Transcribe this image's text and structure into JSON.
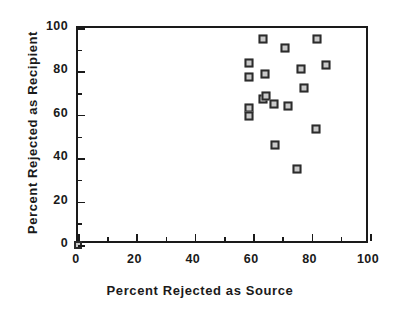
{
  "chart_data": {
    "type": "scatter",
    "title": "",
    "xlabel": "Percent Rejected as Source",
    "ylabel": "Percent Rejected as Recipient",
    "xlim": [
      0,
      100
    ],
    "ylim": [
      0,
      100
    ],
    "xticks": [
      0,
      20,
      40,
      60,
      80,
      100
    ],
    "yticks": [
      0,
      20,
      40,
      60,
      80,
      100
    ],
    "x_minor_ticks": [
      10,
      30,
      50,
      70,
      90
    ],
    "y_minor_ticks": [
      10,
      30,
      50,
      70,
      90
    ],
    "grid": false,
    "legend": null,
    "marker": "open-square",
    "points": [
      {
        "x": 0.0,
        "y": 0.0
      },
      {
        "x": 58.5,
        "y": 84.0
      },
      {
        "x": 58.5,
        "y": 77.5
      },
      {
        "x": 58.5,
        "y": 63.0
      },
      {
        "x": 58.5,
        "y": 59.5
      },
      {
        "x": 63.5,
        "y": 95.0
      },
      {
        "x": 64.0,
        "y": 79.0
      },
      {
        "x": 63.5,
        "y": 67.5
      },
      {
        "x": 64.5,
        "y": 68.5
      },
      {
        "x": 67.0,
        "y": 65.0
      },
      {
        "x": 67.5,
        "y": 46.0
      },
      {
        "x": 71.0,
        "y": 91.0
      },
      {
        "x": 72.0,
        "y": 64.0
      },
      {
        "x": 75.0,
        "y": 35.0
      },
      {
        "x": 76.5,
        "y": 81.0
      },
      {
        "x": 77.5,
        "y": 72.5
      },
      {
        "x": 81.5,
        "y": 53.5
      },
      {
        "x": 82.0,
        "y": 95.0
      },
      {
        "x": 85.0,
        "y": 83.0
      }
    ]
  },
  "axis": {
    "x_tick_labels": [
      "0",
      "20",
      "40",
      "60",
      "80",
      "100"
    ],
    "y_tick_labels": [
      "0",
      "20",
      "40",
      "60",
      "80",
      "100"
    ],
    "x_title": "Percent Rejected as Source",
    "y_title": "Percent Rejected as Recipient"
  },
  "colors": {
    "axis": "#1a1a1a",
    "marker_edge": "#2b2b2b",
    "marker_fill": "#c9c9c9",
    "background": "#ffffff"
  }
}
